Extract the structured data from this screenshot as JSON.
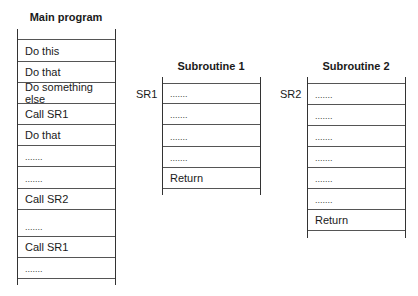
{
  "main": {
    "title": "Main program",
    "rows": [
      "",
      "Do this",
      "Do that",
      "Do something else",
      "Call SR1",
      "Do that",
      ".......",
      ".......",
      "Call SR2",
      ".......",
      "Call SR1",
      "......."
    ]
  },
  "sr1": {
    "title": "Subroutine 1",
    "label": "SR1",
    "rows": [
      ".......",
      ".......",
      ".......",
      ".......",
      "Return"
    ]
  },
  "sr2": {
    "title": "Subroutine 2",
    "label": "SR2",
    "rows": [
      ".......",
      ".......",
      ".......",
      ".......",
      ".......",
      ".......",
      "Return"
    ]
  }
}
